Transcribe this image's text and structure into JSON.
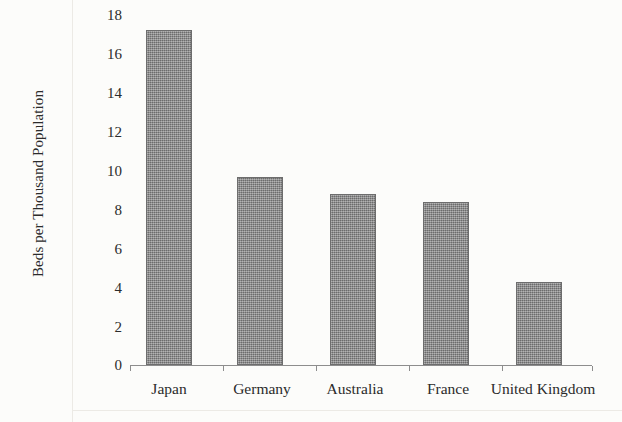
{
  "chart_data": {
    "type": "bar",
    "title": "",
    "subtitle": "",
    "xlabel": "",
    "ylabel": "Beds per Thousand Population",
    "categories": [
      "Japan",
      "Germany",
      "Australia",
      "France",
      "United Kingdom"
    ],
    "values": [
      16.9,
      9.5,
      8.6,
      8.2,
      4.2
    ],
    "ylim": [
      0,
      18
    ],
    "y_ticks": [
      0,
      2,
      4,
      6,
      8,
      10,
      12,
      14,
      16,
      18
    ],
    "y_tick_labels": [
      "0",
      "2",
      "4",
      "6",
      "8",
      "10",
      "12",
      "14",
      "16",
      "18"
    ],
    "grid": false,
    "legend": null,
    "bar_color": "#848484",
    "bar_edge_color": "#6d6d6d",
    "background_color": "#fcfcfa",
    "text_color": "#2b2b2b",
    "annotations": []
  },
  "axes": {
    "y_title": "Beds per Thousand Population",
    "tick_labels": {
      "t18": "18",
      "t16": "16",
      "t14": "14",
      "t12": "12",
      "t10": "10",
      "t8": "8",
      "t6": "6",
      "t4": "4",
      "t2": "2",
      "t0": "0"
    }
  },
  "categories": {
    "c0": "Japan",
    "c1": "Germany",
    "c2": "Australia",
    "c3": "France",
    "c4": "United Kingdom"
  }
}
